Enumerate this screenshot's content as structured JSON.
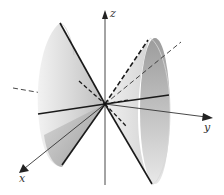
{
  "figure": {
    "axes": {
      "x": {
        "label": "x"
      },
      "y": {
        "label": "y"
      },
      "z": {
        "label": "z"
      }
    },
    "colors": {
      "background": "#ffffff",
      "axis": "#333333",
      "cone_light": "#e6e6e6",
      "cone_mid": "#c8c8c8",
      "cone_dark": "#9a9a9a",
      "cone_inner": "#a8a8a8",
      "ruling_line": "#1a1a1a"
    }
  }
}
